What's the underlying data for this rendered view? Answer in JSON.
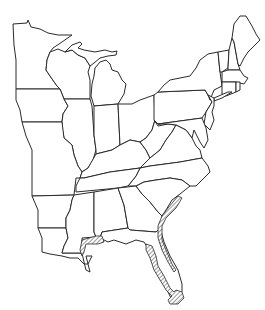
{
  "map": {
    "title": "Outline map of the eastern United States",
    "style": "black line drawing on white",
    "colors": {
      "background": "#ffffff",
      "line": "#2a2a2a",
      "hatch": "#555555"
    },
    "regions": [
      "Minnesota",
      "Wisconsin",
      "Michigan",
      "Iowa",
      "Illinois",
      "Indiana",
      "Ohio",
      "Missouri",
      "Kentucky",
      "West Virginia",
      "Pennsylvania",
      "New York",
      "Vermont",
      "New Hampshire",
      "Maine",
      "Massachusetts",
      "Connecticut",
      "Rhode Island",
      "New Jersey",
      "Delaware",
      "Maryland",
      "Virginia",
      "North Carolina",
      "Tennessee",
      "Arkansas",
      "Louisiana",
      "Mississippi",
      "Alabama",
      "Georgia",
      "South Carolina",
      "Florida"
    ],
    "highlighted_areas": [
      "Gulf Coast (Mississippi / Alabama shoreline)",
      "Atlantic Coast (South Carolina / Georgia / NE Florida)",
      "Florida Gulf Coast and southern tip"
    ],
    "labels_visible": false
  }
}
